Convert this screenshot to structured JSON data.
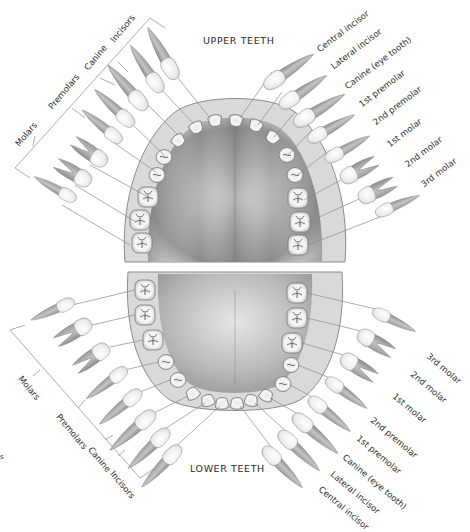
{
  "diagram": {
    "upper_title": "UPPER TEETH",
    "lower_title": "LOWER TEETH",
    "upper_right_labels": [
      "Central incisor",
      "Lateral incisor",
      "Canine (eye tooth)",
      "1st premolar",
      "2nd premolar",
      "1st molar",
      "2nd molar",
      "3rd molar"
    ],
    "lower_right_labels": [
      "3rd molar",
      "2nd molar",
      "1st molar",
      "2nd premolar",
      "1st premolar",
      "Canine (eye tooth)",
      "Lateral incisor",
      "Central incisor"
    ],
    "upper_left_groups": [
      "Molars",
      "Premolars",
      "Canine",
      "Incisors"
    ],
    "lower_left_groups": [
      "Molars",
      "Premolars",
      "Canine",
      "Incisors"
    ],
    "stray_char": "s",
    "colors": {
      "line": "#8a8a8a",
      "text": "#2f2f2f",
      "tooth_crown": "#f2f2f2",
      "tooth_root": "#a9a9a9",
      "palate_dark": "#6e6e6e",
      "gum": "#d6d6d6"
    }
  }
}
